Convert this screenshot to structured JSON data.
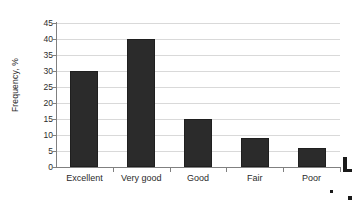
{
  "chart_data": {
    "type": "bar",
    "title": "",
    "categories": [
      "Excellent",
      "Very good",
      "Good",
      "Fair",
      "Poor"
    ],
    "values": [
      30,
      40,
      15,
      9,
      6
    ],
    "xlabel": "",
    "ylabel": "Frequency, %",
    "ylim": [
      0,
      45
    ],
    "ytick_values": [
      0,
      5,
      10,
      15,
      20,
      25,
      30,
      35,
      40,
      45
    ],
    "ytick_labels": [
      "0",
      "5",
      "10",
      "15",
      "20",
      "25",
      "30",
      "35",
      "40",
      "45"
    ],
    "grid": "horizontal",
    "legend": "none",
    "bar_color": "#2b2b2b",
    "gridline_color": "#d9d9d9",
    "axis_color": "#808080",
    "text_color": "#2b2b2b"
  }
}
